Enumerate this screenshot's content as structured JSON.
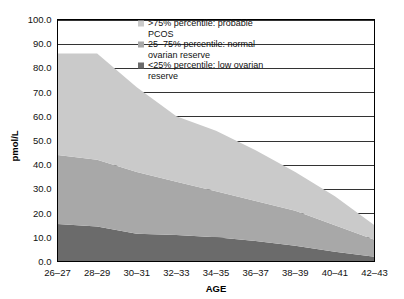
{
  "chart_data": {
    "type": "area",
    "stacked": true,
    "title": "",
    "xlabel": "AGE",
    "ylabel": "pmol/L",
    "categories": [
      "26–27",
      "28–29",
      "30–31",
      "32–33",
      "34–35",
      "36–37",
      "38–39",
      "40–41",
      "42–43"
    ],
    "ylim": [
      0,
      100
    ],
    "ytick_labels": [
      "0.0",
      "10.0",
      "20.0",
      "30.0",
      "40.0",
      "50.0",
      "60.0",
      "70.0",
      "80.0",
      "90.0",
      "100.0"
    ],
    "ytick_values": [
      0,
      10,
      20,
      30,
      40,
      50,
      60,
      70,
      80,
      90,
      100
    ],
    "grid": true,
    "grid_axis": "y",
    "legend_position": "top-right",
    "series": [
      {
        "name": "<25% percentile: low ovarian reserve",
        "short_name": "low-ovarian-reserve",
        "color": "#6b6b6b",
        "values": [
          15.5,
          14.5,
          11.5,
          11.0,
          10.0,
          8.5,
          6.5,
          4.0,
          2.0
        ]
      },
      {
        "name": "25–75% percentile: normal ovarian reserve",
        "short_name": "normal-ovarian-reserve",
        "color": "#a8a8a8",
        "values": [
          28.5,
          27.5,
          25.5,
          22.0,
          19.0,
          16.5,
          14.5,
          11.0,
          7.0
        ]
      },
      {
        "name": ">75% percentile: probable PCOS",
        "short_name": "probable-pcos",
        "color": "#cacaca",
        "values": [
          42.0,
          44.0,
          35.0,
          27.0,
          25.0,
          21.0,
          16.0,
          12.0,
          6.0
        ]
      }
    ],
    "stack_tops": [
      86.0,
      86.0,
      72.0,
      60.0,
      54.0,
      46.0,
      37.0,
      27.0,
      15.0
    ]
  },
  "legend": {
    "entries": [
      {
        "label_line1": ">75% percentile: probable",
        "label_line2": "PCOS",
        "color": "#cacaca"
      },
      {
        "label_line1": "25–75% percentile: normal",
        "label_line2": "ovarian reserve",
        "color": "#a8a8a8"
      },
      {
        "label_line1": "<25% percentile: low ovarian",
        "label_line2": "reserve",
        "color": "#6b6b6b"
      }
    ]
  },
  "axes": {
    "y_label": "pmol/L",
    "x_label": "AGE"
  }
}
